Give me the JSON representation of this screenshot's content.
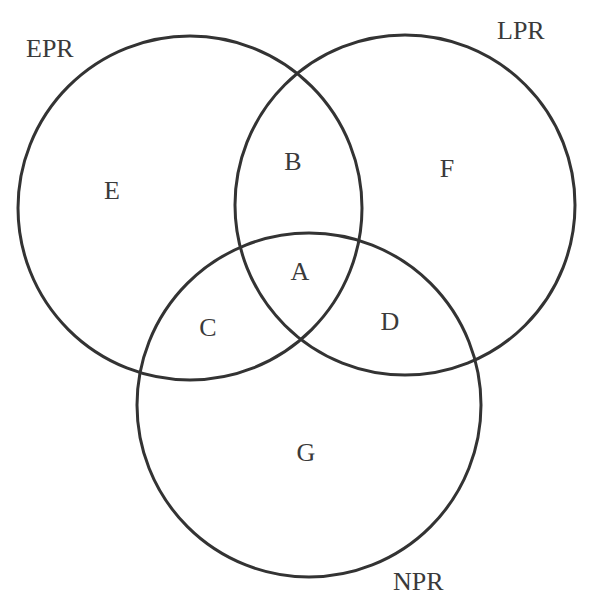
{
  "diagram": {
    "type": "venn",
    "sets": [
      {
        "id": "epr",
        "label": "EPR",
        "cx": 190,
        "cy": 208,
        "r": 172,
        "label_x": 26,
        "label_y": 57
      },
      {
        "id": "lpr",
        "label": "LPR",
        "cx": 405,
        "cy": 205,
        "r": 170,
        "label_x": 497,
        "label_y": 39
      },
      {
        "id": "npr",
        "label": "NPR",
        "cx": 309,
        "cy": 405,
        "r": 172,
        "label_x": 393,
        "label_y": 590
      }
    ],
    "regions": [
      {
        "id": "A",
        "label": "A",
        "x": 300,
        "y": 280,
        "members": [
          "EPR",
          "LPR",
          "NPR"
        ]
      },
      {
        "id": "B",
        "label": "B",
        "x": 293,
        "y": 170,
        "members": [
          "EPR",
          "LPR"
        ]
      },
      {
        "id": "C",
        "label": "C",
        "x": 208,
        "y": 336,
        "members": [
          "EPR",
          "NPR"
        ]
      },
      {
        "id": "D",
        "label": "D",
        "x": 390,
        "y": 330,
        "members": [
          "LPR",
          "NPR"
        ]
      },
      {
        "id": "E",
        "label": "E",
        "x": 112,
        "y": 199,
        "members": [
          "EPR"
        ]
      },
      {
        "id": "F",
        "label": "F",
        "x": 447,
        "y": 177,
        "members": [
          "LPR"
        ]
      },
      {
        "id": "G",
        "label": "G",
        "x": 306,
        "y": 461,
        "members": [
          "NPR"
        ]
      }
    ],
    "stroke_color": "#333333",
    "text_color": "#3a3a3a",
    "background": "#ffffff"
  }
}
